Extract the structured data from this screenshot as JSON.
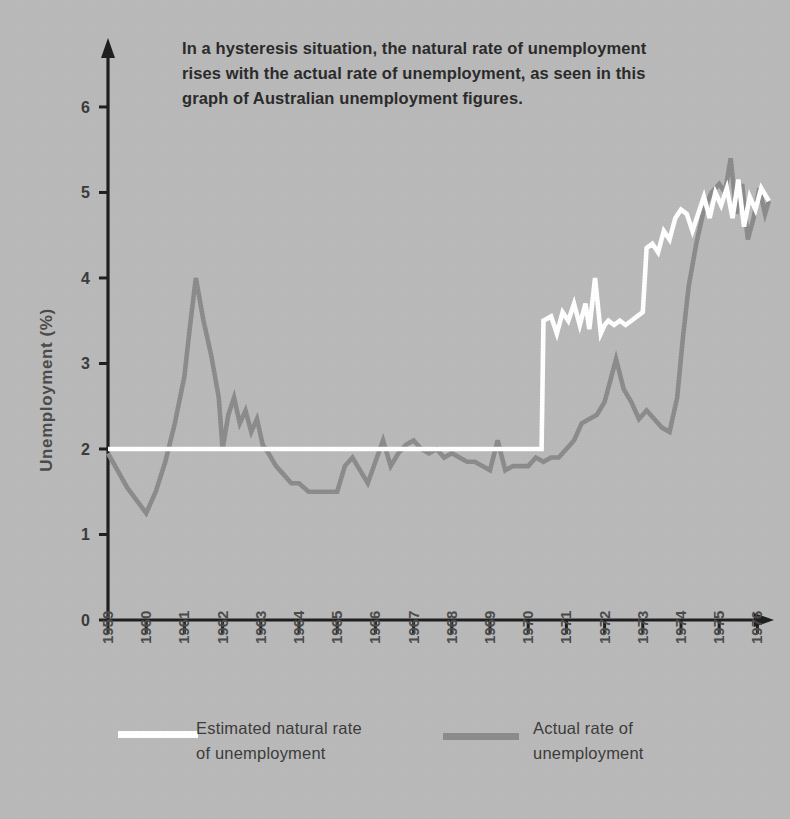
{
  "figure": {
    "background_color": "#b9b9b9",
    "caption": "In a hysteresis situation, the natural rate of unemployment\nrises with the actual rate of unemployment, as seen in this\ngraph of Australian unemployment figures."
  },
  "legend": {
    "position": "bottom",
    "items": [
      {
        "label": "Estimated natural rate\nof unemployment",
        "color": "#ffffff",
        "swatch": "line-swatch-white"
      },
      {
        "label": "Actual rate of\nunemployment",
        "color": "#8b8b8b",
        "swatch": "line-swatch-gray"
      }
    ]
  },
  "chart_data": {
    "type": "line",
    "title": "In a hysteresis situation, the natural rate of unemployment rises with the actual rate of unemployment, as seen in this graph of Australian unemployment figures.",
    "xlabel": "",
    "ylabel": "Unemployment (%)",
    "xlim": [
      1959,
      1976.5
    ],
    "ylim": [
      0,
      6.6
    ],
    "grid": false,
    "yticks": [
      0,
      1,
      2,
      3,
      4,
      5,
      6
    ],
    "ytick_labels": [
      "0",
      "1",
      "2",
      "3",
      "4",
      "5",
      "6"
    ],
    "xticks": [
      1959,
      1960,
      1961,
      1962,
      1963,
      1964,
      1965,
      1966,
      1967,
      1968,
      1969,
      1970,
      1971,
      1972,
      1973,
      1974,
      1975,
      1976
    ],
    "xtick_labels": [
      "1959",
      "1960",
      "1961",
      "1962",
      "1963",
      "1964",
      "1965",
      "1966",
      "1967",
      "1968",
      "1969",
      "1970",
      "1971",
      "1972",
      "1973",
      "1974",
      "1975",
      "1976"
    ],
    "series": [
      {
        "name": "Estimated natural rate of unemployment",
        "color": "#ffffff",
        "x": [
          1959.0,
          1970.35,
          1970.4,
          1970.6,
          1970.75,
          1970.9,
          1971.05,
          1971.2,
          1971.35,
          1971.5,
          1971.6,
          1971.75,
          1971.9,
          1972.0,
          1972.1,
          1972.25,
          1972.4,
          1972.55,
          1972.7,
          1972.85,
          1973.0,
          1973.1,
          1973.25,
          1973.4,
          1973.55,
          1973.7,
          1973.85,
          1974.0,
          1974.15,
          1974.3,
          1974.45,
          1974.6,
          1974.75,
          1974.9,
          1975.05,
          1975.2,
          1975.35,
          1975.5,
          1975.65,
          1975.8,
          1975.95,
          1976.1,
          1976.3
        ],
        "y": [
          2.0,
          2.0,
          3.5,
          3.55,
          3.35,
          3.6,
          3.5,
          3.7,
          3.45,
          3.7,
          3.4,
          4.0,
          3.35,
          3.45,
          3.5,
          3.45,
          3.5,
          3.45,
          3.5,
          3.55,
          3.6,
          4.35,
          4.4,
          4.3,
          4.55,
          4.45,
          4.7,
          4.8,
          4.75,
          4.55,
          4.75,
          4.95,
          4.7,
          5.0,
          4.85,
          5.05,
          4.7,
          5.15,
          4.6,
          4.95,
          4.8,
          5.05,
          4.9
        ]
      },
      {
        "name": "Actual rate of unemployment",
        "color": "#8b8b8b",
        "x": [
          1959.0,
          1959.25,
          1959.5,
          1959.75,
          1960.0,
          1960.25,
          1960.5,
          1960.75,
          1961.0,
          1961.15,
          1961.3,
          1961.5,
          1961.7,
          1961.9,
          1962.0,
          1962.15,
          1962.3,
          1962.45,
          1962.6,
          1962.75,
          1962.9,
          1963.05,
          1963.2,
          1963.4,
          1963.6,
          1963.8,
          1964.0,
          1964.25,
          1964.5,
          1964.75,
          1965.0,
          1965.2,
          1965.4,
          1965.6,
          1965.8,
          1966.0,
          1966.2,
          1966.4,
          1966.6,
          1966.8,
          1967.0,
          1967.2,
          1967.4,
          1967.6,
          1967.8,
          1968.0,
          1968.2,
          1968.4,
          1968.6,
          1968.8,
          1969.0,
          1969.2,
          1969.4,
          1969.6,
          1969.8,
          1970.0,
          1970.2,
          1970.4,
          1970.6,
          1970.8,
          1971.0,
          1971.2,
          1971.4,
          1971.6,
          1971.8,
          1972.0,
          1972.15,
          1972.3,
          1972.5,
          1972.7,
          1972.9,
          1973.1,
          1973.3,
          1973.5,
          1973.7,
          1973.9,
          1974.05,
          1974.2,
          1974.4,
          1974.6,
          1974.8,
          1975.0,
          1975.15,
          1975.3,
          1975.45,
          1975.6,
          1975.75,
          1975.9,
          1976.05,
          1976.2,
          1976.3
        ],
        "y": [
          1.95,
          1.75,
          1.55,
          1.4,
          1.25,
          1.5,
          1.85,
          2.3,
          2.85,
          3.45,
          4.0,
          3.5,
          3.1,
          2.6,
          2.0,
          2.4,
          2.6,
          2.3,
          2.45,
          2.2,
          2.35,
          2.05,
          1.95,
          1.8,
          1.7,
          1.6,
          1.6,
          1.5,
          1.5,
          1.5,
          1.5,
          1.8,
          1.9,
          1.75,
          1.6,
          1.85,
          2.1,
          1.8,
          1.95,
          2.05,
          2.1,
          2.0,
          1.95,
          2.0,
          1.9,
          1.95,
          1.9,
          1.85,
          1.85,
          1.8,
          1.75,
          2.1,
          1.75,
          1.8,
          1.8,
          1.8,
          1.9,
          1.85,
          1.9,
          1.9,
          2.0,
          2.1,
          2.3,
          2.35,
          2.4,
          2.55,
          2.8,
          3.05,
          2.7,
          2.55,
          2.35,
          2.45,
          2.35,
          2.25,
          2.2,
          2.6,
          3.3,
          3.9,
          4.4,
          4.8,
          5.0,
          5.1,
          5.0,
          5.4,
          4.75,
          5.1,
          4.45,
          4.7,
          5.05,
          4.75,
          4.9
        ]
      }
    ]
  }
}
